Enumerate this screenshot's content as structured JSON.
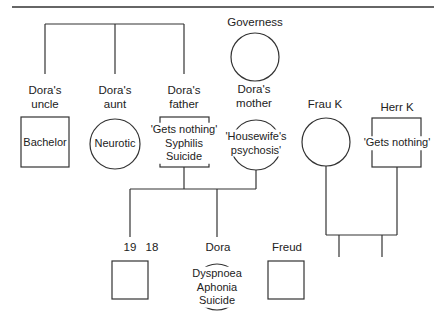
{
  "diagram": {
    "generation1": {
      "uncle": {
        "label_line1": "Dora's",
        "label_line2": "uncle",
        "symbol": "square",
        "note": "Bachelor"
      },
      "aunt": {
        "label_line1": "Dora's",
        "label_line2": "aunt",
        "symbol": "circle",
        "note": "Neurotic"
      },
      "father": {
        "label_line1": "Dora's",
        "label_line2": "father",
        "symbol": "square",
        "note_line1": "'Gets nothing'",
        "note_line2": "Syphilis",
        "note_line3": "Suicide"
      },
      "mother": {
        "label_line1": "Dora's",
        "label_line2": "mother",
        "symbol": "circle",
        "note_line1": "'Housewife's",
        "note_line2": "psychosis'"
      },
      "governess": {
        "label": "Governess",
        "symbol": "circle"
      },
      "frau_k": {
        "label": "Frau K",
        "symbol": "circle"
      },
      "herr_k": {
        "label": "Herr K",
        "symbol": "square",
        "note": "'Gets nothing'"
      }
    },
    "generation2": {
      "brother": {
        "age1": "19",
        "age2": "18",
        "symbol": "square"
      },
      "dora": {
        "label": "Dora",
        "symbol": "circle",
        "note_line1": "Dyspnoea",
        "note_line2": "Aphonia",
        "note_line3": "Suicide"
      },
      "freud": {
        "label": "Freud",
        "symbol": "square"
      }
    }
  }
}
